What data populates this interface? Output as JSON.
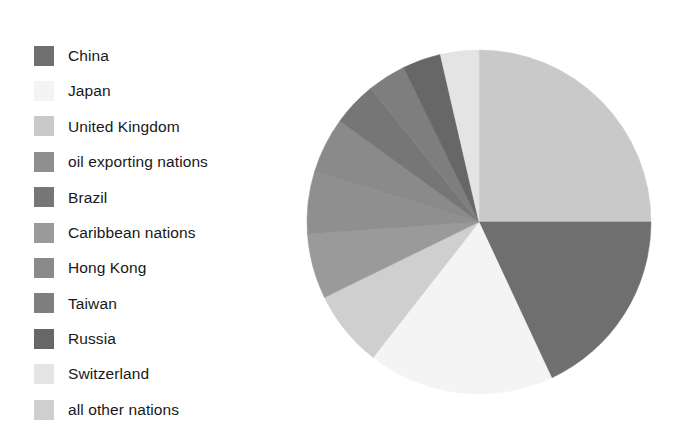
{
  "figure": {
    "background_color": "#ffffff",
    "kind": "pie-chart-with-legend"
  },
  "legend": {
    "position": "left",
    "items": [
      {
        "label": "China",
        "color": "#6f6f6f"
      },
      {
        "label": "Japan",
        "color": "#f4f4f4"
      },
      {
        "label": "United Kingdom",
        "color": "#c9c9c9"
      },
      {
        "label": "oil exporting nations",
        "color": "#8f8f8f"
      },
      {
        "label": "Brazil",
        "color": "#767676"
      },
      {
        "label": "Caribbean nations",
        "color": "#9a9a9a"
      },
      {
        "label": "Hong Kong",
        "color": "#8a8a8a"
      },
      {
        "label": "Taiwan",
        "color": "#7e7e7e"
      },
      {
        "label": "Russia",
        "color": "#676767"
      },
      {
        "label": "Switzerland",
        "color": "#e4e4e4"
      },
      {
        "label": "all other nations",
        "color": "#cfcfcf"
      }
    ]
  },
  "chart_data": {
    "type": "pie",
    "title": "",
    "subtitle": "",
    "xlabel": "",
    "ylabel": "",
    "grid": false,
    "legend_position": "left",
    "start_angle_deg": 0,
    "direction": "clockwise",
    "center": {
      "x": 176,
      "y": 178
    },
    "radius": 172,
    "categories": [
      "China",
      "Japan",
      "United Kingdom",
      "oil exporting nations",
      "Brazil",
      "Caribbean nations",
      "Hong Kong",
      "Taiwan",
      "Russia",
      "Switzerland",
      "all other nations"
    ],
    "values": [
      18.1,
      17.5,
      25.0,
      5.8,
      4.2,
      6.1,
      5.3,
      3.6,
      3.6,
      3.6,
      7.2
    ],
    "unit": "percent",
    "slices": [
      {
        "label": "United Kingdom",
        "value": 25.0,
        "color": "#c9c9c9",
        "start_deg": 0.0,
        "end_deg": 90.0
      },
      {
        "label": "China",
        "value": 18.1,
        "color": "#6f6f6f",
        "start_deg": 90.0,
        "end_deg": 155.0
      },
      {
        "label": "Japan",
        "value": 17.5,
        "color": "#f4f4f4",
        "start_deg": 155.0,
        "end_deg": 218.0
      },
      {
        "label": "all other nations",
        "value": 7.2,
        "color": "#cfcfcf",
        "start_deg": 218.0,
        "end_deg": 244.0
      },
      {
        "label": "Caribbean nations",
        "value": 6.1,
        "color": "#9a9a9a",
        "start_deg": 244.0,
        "end_deg": 266.0
      },
      {
        "label": "oil exporting nations",
        "value": 5.8,
        "color": "#8f8f8f",
        "start_deg": 266.0,
        "end_deg": 287.0
      },
      {
        "label": "Hong Kong",
        "value": 5.3,
        "color": "#8a8a8a",
        "start_deg": 287.0,
        "end_deg": 306.0
      },
      {
        "label": "Brazil",
        "value": 4.2,
        "color": "#767676",
        "start_deg": 306.0,
        "end_deg": 321.0
      },
      {
        "label": "Taiwan",
        "value": 3.6,
        "color": "#7e7e7e",
        "start_deg": 321.0,
        "end_deg": 334.0
      },
      {
        "label": "Russia",
        "value": 3.6,
        "color": "#676767",
        "start_deg": 334.0,
        "end_deg": 347.0
      },
      {
        "label": "Switzerland",
        "value": 3.6,
        "color": "#e4e4e4",
        "start_deg": 347.0,
        "end_deg": 360.0
      }
    ]
  }
}
